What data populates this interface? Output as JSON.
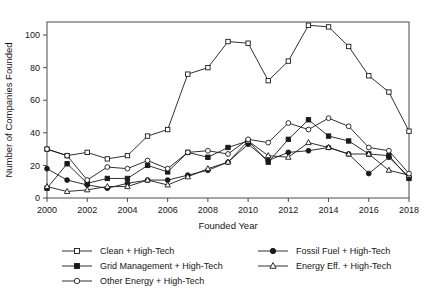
{
  "chart_data": {
    "type": "line",
    "title": "",
    "xlabel": "Founded Year",
    "ylabel": "Number of Companies Founded",
    "xlim": [
      2000,
      2018
    ],
    "ylim": [
      0,
      108
    ],
    "grid": false,
    "legend_position": "bottom",
    "x": [
      2000,
      2001,
      2002,
      2003,
      2004,
      2005,
      2006,
      2007,
      2008,
      2009,
      2010,
      2011,
      2012,
      2013,
      2014,
      2015,
      2016,
      2017,
      2018
    ],
    "xticks": [
      "2000",
      "2002",
      "2004",
      "2006",
      "2008",
      "2010",
      "2012",
      "2014",
      "2016",
      "2018"
    ],
    "xtick_values": [
      2000,
      2002,
      2004,
      2006,
      2008,
      2010,
      2012,
      2014,
      2016,
      2018
    ],
    "yticks": [
      "0",
      "20",
      "40",
      "60",
      "80",
      "100"
    ],
    "ytick_values": [
      0,
      20,
      40,
      60,
      80,
      100
    ],
    "series": [
      {
        "name": "Clean + High-Tech",
        "marker": "open-square",
        "values": [
          30,
          26,
          28,
          24,
          26,
          38,
          42,
          76,
          80,
          96,
          95,
          72,
          84,
          106,
          105,
          93,
          75,
          65,
          41
        ]
      },
      {
        "name": "Fossil Fuel + High-Tech",
        "marker": "filled-circle",
        "values": [
          18,
          11,
          8,
          6,
          9,
          11,
          11,
          14,
          17,
          22,
          33,
          23,
          28,
          29,
          31,
          27,
          15,
          25,
          13
        ]
      },
      {
        "name": "Grid Management + High-Tech",
        "marker": "filled-square",
        "values": [
          6,
          21,
          9,
          12,
          12,
          20,
          16,
          28,
          25,
          31,
          35,
          22,
          36,
          48,
          38,
          35,
          27,
          26,
          12
        ]
      },
      {
        "name": "Energy Eff. + High-Tech",
        "marker": "open-triangle",
        "values": [
          7,
          4,
          5,
          7,
          7,
          11,
          8,
          13,
          18,
          22,
          35,
          26,
          25,
          34,
          31,
          27,
          27,
          17,
          14
        ]
      },
      {
        "name": "Other Energy + High-Tech",
        "marker": "open-circle",
        "values": [
          30,
          26,
          11,
          19,
          18,
          23,
          18,
          28,
          29,
          27,
          36,
          34,
          46,
          42,
          49,
          44,
          31,
          29,
          15
        ]
      }
    ]
  },
  "legend": {
    "entries": [
      {
        "label": "Clean + High-Tech",
        "marker": "open-square"
      },
      {
        "label": "Fossil Fuel + High-Tech",
        "marker": "filled-circle"
      },
      {
        "label": "Grid Management + High-Tech",
        "marker": "filled-square"
      },
      {
        "label": "Energy Eff. + High-Tech",
        "marker": "open-triangle"
      },
      {
        "label": "Other Energy + High-Tech",
        "marker": "open-circle"
      }
    ]
  },
  "colors": {
    "ink": "#1a1a1a",
    "axis": "#4a4a4a",
    "background": "#ffffff"
  }
}
